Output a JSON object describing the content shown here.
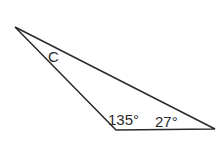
{
  "diagram": {
    "type": "triangle",
    "vertices": {
      "top_left": [
        15,
        27
      ],
      "bottom_left": [
        116,
        130
      ],
      "bottom_right": [
        215,
        129
      ]
    },
    "angle_labels": {
      "top_left": "C",
      "bottom_left": "135°",
      "bottom_right": "27°"
    },
    "stroke_color": "#2a2a2a",
    "background": "#ffffff"
  }
}
